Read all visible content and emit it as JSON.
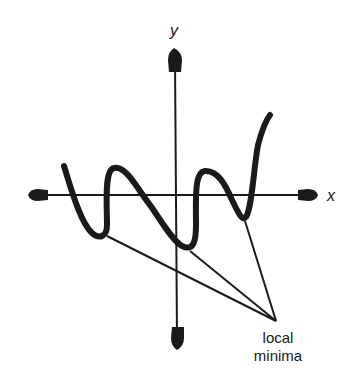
{
  "diagram": {
    "title": "",
    "axes": {
      "x_label": "x",
      "y_label": "y"
    },
    "annotation": {
      "line1": "local",
      "line2": "minima",
      "points_to": [
        "local-minimum-1",
        "local-minimum-2",
        "local-minimum-3"
      ]
    },
    "curve": {
      "description": "Polynomial-like curve crossing x-axis multiple times with three local minima below the x-axis and rising steeply at the right",
      "local_minima_count": 3,
      "local_maxima_count": 2
    },
    "colors": {
      "ink": "#1a1a1a",
      "background": "#ffffff"
    }
  }
}
